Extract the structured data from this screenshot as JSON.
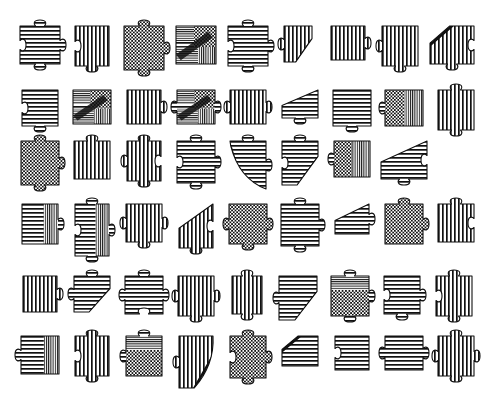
{
  "sheet": {
    "title": "Jigsaw Puzzle Pieces Sheet",
    "description": "Black and white engraved-style illustration sheet of individual jigsaw puzzle pieces arranged in a grid",
    "style": "line-art engraving / hatch-shaded",
    "background_color": "#ffffff",
    "ink_color": "#111111",
    "width_px": 435,
    "height_px": 413,
    "rows": 6,
    "total_pieces": 53,
    "pattern_legend": [
      {
        "key": "h",
        "name": "horizontal-hatch"
      },
      {
        "key": "v",
        "name": "vertical-hatch"
      },
      {
        "key": "c",
        "name": "checkerboard"
      },
      {
        "key": "m",
        "name": "mixed-collage"
      },
      {
        "key": "hv",
        "name": "horizontal-vertical-split"
      },
      {
        "key": "cv",
        "name": "checker-vertical-split"
      },
      {
        "key": "ch",
        "name": "checker-horizontal-split"
      }
    ],
    "edge_legend": [
      {
        "key": "0",
        "name": "flat-edge"
      },
      {
        "key": "1",
        "name": "tab-knob-out"
      },
      {
        "key": "-1",
        "name": "blank-socket-in"
      }
    ],
    "cut_legend": [
      {
        "key": "none",
        "name": "square-piece"
      },
      {
        "key": "diag-bl",
        "name": "diagonal-cut-bottom-left"
      },
      {
        "key": "diag-br",
        "name": "diagonal-cut-bottom-right"
      },
      {
        "key": "diag-tr",
        "name": "diagonal-cut-top-right"
      },
      {
        "key": "diag-tl",
        "name": "diagonal-cut-top-left"
      },
      {
        "key": "curve-bl",
        "name": "curved-cut-bottom-left"
      },
      {
        "key": "curve-br",
        "name": "curved-cut-bottom-right"
      }
    ]
  },
  "rows": [
    {
      "index": 1,
      "top": 18,
      "left_offset": 16,
      "gap": 4,
      "count": 9,
      "pieces": [
        {
          "id": "r1c1",
          "pattern": "h",
          "edges": {
            "top": 1,
            "right": 1,
            "bottom": 1,
            "left": -1
          },
          "cut": "none",
          "width": 40,
          "height": 38
        },
        {
          "id": "r1c2",
          "pattern": "v",
          "edges": {
            "top": 0,
            "right": 0,
            "bottom": 1,
            "left": -1
          },
          "cut": "none",
          "width": 34,
          "height": 40
        },
        {
          "id": "r1c3",
          "pattern": "c",
          "edges": {
            "top": 1,
            "right": 1,
            "bottom": 1,
            "left": 0
          },
          "cut": "none",
          "width": 40,
          "height": 44
        },
        {
          "id": "r1c4",
          "pattern": "m",
          "edges": {
            "top": 0,
            "right": 0,
            "bottom": 0,
            "left": 0
          },
          "cut": "none",
          "width": 40,
          "height": 38
        },
        {
          "id": "r1c5",
          "pattern": "h",
          "edges": {
            "top": 1,
            "right": 1,
            "bottom": 1,
            "left": -1
          },
          "cut": "none",
          "width": 40,
          "height": 40
        },
        {
          "id": "r1c6",
          "pattern": "v",
          "edges": {
            "top": 0,
            "right": 0,
            "bottom": 0,
            "left": 1
          },
          "cut": "diag-br",
          "width": 28,
          "height": 36
        },
        {
          "id": "r1c7",
          "pattern": "v",
          "edges": {
            "top": 0,
            "right": 1,
            "bottom": 0,
            "left": 0
          },
          "cut": "none",
          "width": 34,
          "height": 34
        },
        {
          "id": "r1c8",
          "pattern": "v",
          "edges": {
            "top": 0,
            "right": 0,
            "bottom": 1,
            "left": 1
          },
          "cut": "none",
          "width": 36,
          "height": 40
        },
        {
          "id": "r1c9",
          "pattern": "v",
          "edges": {
            "top": 0,
            "right": -1,
            "bottom": 1,
            "left": 0
          },
          "cut": "diag-bl",
          "width": 44,
          "height": 38
        }
      ]
    },
    {
      "index": 2,
      "top": 82,
      "left_offset": 16,
      "gap": 4,
      "count": 9,
      "pieces": [
        {
          "id": "r2c1",
          "pattern": "h",
          "edges": {
            "top": 0,
            "right": 0,
            "bottom": 1,
            "left": -1
          },
          "cut": "none",
          "width": 36,
          "height": 36
        },
        {
          "id": "r2c2",
          "pattern": "m",
          "edges": {
            "top": 0,
            "right": 0,
            "bottom": 0,
            "left": 0
          },
          "cut": "none",
          "width": 38,
          "height": 34
        },
        {
          "id": "r2c3",
          "pattern": "v",
          "edges": {
            "top": 0,
            "right": 1,
            "bottom": 0,
            "left": 0
          },
          "cut": "none",
          "width": 34,
          "height": 34
        },
        {
          "id": "r2c4",
          "pattern": "m",
          "edges": {
            "top": 0,
            "right": 1,
            "bottom": 0,
            "left": 1
          },
          "cut": "none",
          "width": 38,
          "height": 34
        },
        {
          "id": "r2c5",
          "pattern": "v",
          "edges": {
            "top": 0,
            "right": 1,
            "bottom": 0,
            "left": 1
          },
          "cut": "none",
          "width": 36,
          "height": 34
        },
        {
          "id": "r2c6",
          "pattern": "h",
          "edges": {
            "top": 0,
            "right": 0,
            "bottom": 1,
            "left": 0
          },
          "cut": "diag-tl",
          "width": 36,
          "height": 28
        },
        {
          "id": "r2c7",
          "pattern": "h",
          "edges": {
            "top": 0,
            "right": 0,
            "bottom": 1,
            "left": 0
          },
          "cut": "none",
          "width": 38,
          "height": 36
        },
        {
          "id": "r2c8",
          "pattern": "cv",
          "edges": {
            "top": 0,
            "right": 0,
            "bottom": 0,
            "left": 1
          },
          "cut": "none",
          "width": 38,
          "height": 36
        },
        {
          "id": "r2c9",
          "pattern": "v",
          "edges": {
            "top": 1,
            "right": 0,
            "bottom": 1,
            "left": 0
          },
          "cut": "none",
          "width": 36,
          "height": 40
        }
      ]
    },
    {
      "index": 3,
      "top": 133,
      "left_offset": 16,
      "gap": 4,
      "count": 8,
      "pieces": [
        {
          "id": "r3c1",
          "pattern": "c",
          "edges": {
            "top": 1,
            "right": 1,
            "bottom": 1,
            "left": 0
          },
          "cut": "none",
          "width": 38,
          "height": 44
        },
        {
          "id": "r3c2",
          "pattern": "v",
          "edges": {
            "top": 1,
            "right": 0,
            "bottom": 0,
            "left": 0
          },
          "cut": "none",
          "width": 36,
          "height": 38
        },
        {
          "id": "r3c3",
          "pattern": "v",
          "edges": {
            "top": 1,
            "right": -1,
            "bottom": 1,
            "left": 1
          },
          "cut": "none",
          "width": 34,
          "height": 40
        },
        {
          "id": "r3c4",
          "pattern": "h",
          "edges": {
            "top": 1,
            "right": 1,
            "bottom": 1,
            "left": -1
          },
          "cut": "none",
          "width": 38,
          "height": 42
        },
        {
          "id": "r3c5",
          "pattern": "h",
          "edges": {
            "top": 1,
            "right": 1,
            "bottom": 0,
            "left": 0
          },
          "cut": "curve-bl",
          "width": 36,
          "height": 48
        },
        {
          "id": "r3c6",
          "pattern": "h",
          "edges": {
            "top": 1,
            "right": 0,
            "bottom": 0,
            "left": -1
          },
          "cut": "diag-br",
          "width": 36,
          "height": 44
        },
        {
          "id": "r3c7",
          "pattern": "cv",
          "edges": {
            "top": 0,
            "right": 0,
            "bottom": 0,
            "left": 1
          },
          "cut": "none",
          "width": 36,
          "height": 36
        },
        {
          "id": "r3c8",
          "pattern": "h",
          "edges": {
            "top": 1,
            "right": -1,
            "bottom": 1,
            "left": 0
          },
          "cut": "diag-tl",
          "width": 46,
          "height": 38
        }
      ]
    },
    {
      "index": 4,
      "top": 196,
      "left_offset": 16,
      "gap": 4,
      "count": 9,
      "pieces": [
        {
          "id": "r4c1",
          "pattern": "hv",
          "edges": {
            "top": 0,
            "right": 1,
            "bottom": 0,
            "left": 0
          },
          "cut": "none",
          "width": 36,
          "height": 40
        },
        {
          "id": "r4c2",
          "pattern": "hv",
          "edges": {
            "top": 1,
            "right": 1,
            "bottom": 1,
            "left": -1
          },
          "cut": "none",
          "width": 34,
          "height": 52
        },
        {
          "id": "r4c3",
          "pattern": "v",
          "edges": {
            "top": 0,
            "right": 1,
            "bottom": 1,
            "left": 1
          },
          "cut": "none",
          "width": 36,
          "height": 38
        },
        {
          "id": "r4c4",
          "pattern": "v",
          "edges": {
            "top": 0,
            "right": -1,
            "bottom": 1,
            "left": 0
          },
          "cut": "diag-tl",
          "width": 34,
          "height": 44
        },
        {
          "id": "r4c5",
          "pattern": "c",
          "edges": {
            "top": 0,
            "right": 1,
            "bottom": 1,
            "left": 1
          },
          "cut": "none",
          "width": 38,
          "height": 40
        },
        {
          "id": "r4c6",
          "pattern": "h",
          "edges": {
            "top": 1,
            "right": 1,
            "bottom": 1,
            "left": 0
          },
          "cut": "none",
          "width": 38,
          "height": 42
        },
        {
          "id": "r4c7",
          "pattern": "h",
          "edges": {
            "top": 0,
            "right": 1,
            "bottom": 0,
            "left": 0
          },
          "cut": "diag-tl",
          "width": 34,
          "height": 30
        },
        {
          "id": "r4c8",
          "pattern": "c",
          "edges": {
            "top": 1,
            "right": 1,
            "bottom": 0,
            "left": 0
          },
          "cut": "none",
          "width": 38,
          "height": 40
        },
        {
          "id": "r4c9",
          "pattern": "v",
          "edges": {
            "top": 1,
            "right": -1,
            "bottom": 0,
            "left": 0
          },
          "cut": "none",
          "width": 36,
          "height": 38
        }
      ]
    },
    {
      "index": 5,
      "top": 268,
      "left_offset": 16,
      "gap": 4,
      "count": 9,
      "pieces": [
        {
          "id": "r5c1",
          "pattern": "v",
          "edges": {
            "top": 0,
            "right": 1,
            "bottom": 0,
            "left": 0
          },
          "cut": "none",
          "width": 34,
          "height": 36
        },
        {
          "id": "r5c2",
          "pattern": "h",
          "edges": {
            "top": 1,
            "right": 1,
            "bottom": 0,
            "left": 1
          },
          "cut": "diag-br",
          "width": 36,
          "height": 36
        },
        {
          "id": "r5c3",
          "pattern": "h",
          "edges": {
            "top": 1,
            "right": 1,
            "bottom": -1,
            "left": 1
          },
          "cut": "none",
          "width": 38,
          "height": 38
        },
        {
          "id": "r5c4",
          "pattern": "v",
          "edges": {
            "top": 0,
            "right": 1,
            "bottom": 1,
            "left": 1
          },
          "cut": "none",
          "width": 36,
          "height": 40
        },
        {
          "id": "r5c5",
          "pattern": "v",
          "edges": {
            "top": 1,
            "right": 0,
            "bottom": 1,
            "left": 0
          },
          "cut": "none",
          "width": 30,
          "height": 38
        },
        {
          "id": "r5c6",
          "pattern": "h",
          "edges": {
            "top": 0,
            "right": 1,
            "bottom": 0,
            "left": 1
          },
          "cut": "diag-br",
          "width": 38,
          "height": 44
        },
        {
          "id": "r5c7",
          "pattern": "ch",
          "edges": {
            "top": 1,
            "right": 1,
            "bottom": 1,
            "left": 0
          },
          "cut": "none",
          "width": 38,
          "height": 40
        },
        {
          "id": "r5c8",
          "pattern": "h",
          "edges": {
            "top": 0,
            "right": 1,
            "bottom": 1,
            "left": -1
          },
          "cut": "none",
          "width": 36,
          "height": 38
        },
        {
          "id": "r5c9",
          "pattern": "v",
          "edges": {
            "top": 1,
            "right": 0,
            "bottom": 1,
            "left": -1
          },
          "cut": "none",
          "width": 36,
          "height": 40
        }
      ]
    },
    {
      "index": 6,
      "top": 328,
      "left_offset": 16,
      "gap": 4,
      "count": 9,
      "pieces": [
        {
          "id": "r6c1",
          "pattern": "hv",
          "edges": {
            "top": 0,
            "right": 0,
            "bottom": 0,
            "left": 1
          },
          "cut": "none",
          "width": 38,
          "height": 38
        },
        {
          "id": "r6c2",
          "pattern": "v",
          "edges": {
            "top": 1,
            "right": 0,
            "bottom": 1,
            "left": -1
          },
          "cut": "none",
          "width": 34,
          "height": 40
        },
        {
          "id": "r6c3",
          "pattern": "ch",
          "edges": {
            "top": 1,
            "right": 0,
            "bottom": 0,
            "left": 1
          },
          "cut": "none",
          "width": 36,
          "height": 40
        },
        {
          "id": "r6c4",
          "pattern": "v",
          "edges": {
            "top": 0,
            "right": 0,
            "bottom": 0,
            "left": 1
          },
          "cut": "curve-br",
          "width": 34,
          "height": 52
        },
        {
          "id": "r6c5",
          "pattern": "c",
          "edges": {
            "top": 1,
            "right": 1,
            "bottom": 1,
            "left": -1
          },
          "cut": "none",
          "width": 36,
          "height": 42
        },
        {
          "id": "r6c6",
          "pattern": "h",
          "edges": {
            "top": 0,
            "right": 0,
            "bottom": 0,
            "left": 1
          },
          "cut": "diag-bl",
          "width": 36,
          "height": 30
        },
        {
          "id": "r6c7",
          "pattern": "h",
          "edges": {
            "top": 0,
            "right": 0,
            "bottom": 0,
            "left": -1
          },
          "cut": "none",
          "width": 34,
          "height": 34
        },
        {
          "id": "r6c8",
          "pattern": "h",
          "edges": {
            "top": 0,
            "right": 1,
            "bottom": 0,
            "left": 1
          },
          "cut": "none",
          "width": 38,
          "height": 34
        },
        {
          "id": "r6c9",
          "pattern": "v",
          "edges": {
            "top": 1,
            "right": 1,
            "bottom": 1,
            "left": 1
          },
          "cut": "none",
          "width": 36,
          "height": 40
        }
      ]
    }
  ]
}
